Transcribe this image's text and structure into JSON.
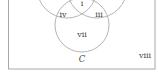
{
  "diagram": {
    "type": "venn",
    "sets": [
      "A",
      "B",
      "C"
    ],
    "visible_set_labels": {
      "C": "C"
    },
    "region_labels": {
      "i": "i",
      "iii": "iii",
      "iv": "iv",
      "vii": "vii",
      "viii": "viii"
    },
    "colors": {
      "stroke": "#b5b5b5",
      "border": "#a8a8a8",
      "text": "#444444",
      "background": "#ffffff"
    }
  }
}
